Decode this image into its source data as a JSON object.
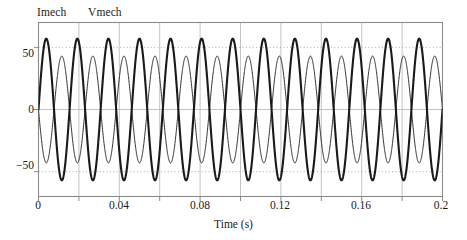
{
  "chart_data": {
    "type": "line",
    "title": "",
    "subtitle": "",
    "xlabel": "Time (s)",
    "ylabel": "",
    "xlim": [
      0,
      0.2
    ],
    "ylim": [
      -70,
      70
    ],
    "xticks": [
      0,
      0.02,
      0.04,
      0.06,
      0.08,
      0.1,
      0.12,
      0.14,
      0.16,
      0.18,
      0.2
    ],
    "xtick_labels": [
      "0",
      "",
      "0.04",
      "",
      "0.08",
      "",
      "0.12",
      "",
      "0.16",
      "",
      "0.2"
    ],
    "yticks": [
      -50,
      0,
      50
    ],
    "ytick_labels": [
      "−50",
      "0",
      "50"
    ],
    "grid": {
      "vertical": "solid at every 0.02 s",
      "horizontal": "dotted at ±50, solid at 0"
    },
    "legend_position": "above plot, top-left",
    "frequency_hz": 65,
    "cycles_shown": 13,
    "series": [
      {
        "name": "Imech",
        "style": "thick",
        "linewidth": 2.1,
        "color": "#1a1a1a",
        "amplitude": 57,
        "phase_deg": 0,
        "offset": 0,
        "description": "Mechanical current, thick trace, starts at 0 rising"
      },
      {
        "name": "Vmech",
        "style": "thin",
        "linewidth": 0.9,
        "color": "#1a1a1a",
        "amplitude": 43,
        "phase_deg": 180,
        "offset": 0,
        "description": "Mechanical voltage, thin trace, starts at 0 falling"
      }
    ]
  },
  "legend": {
    "imech": "Imech",
    "vmech": "Vmech"
  },
  "axis": {
    "x_title": "Time (s)",
    "x_labels": [
      "0",
      "0.04",
      "0.08",
      "0.12",
      "0.16",
      "0.2"
    ],
    "y_labels": [
      "50",
      "0",
      "−50"
    ]
  },
  "colors": {
    "trace": "#1a1a1a",
    "frame": "#8a8a8a",
    "grid_major": "#b4b4b4",
    "grid_dotted": "#9a9a9a",
    "background": "#ffffff",
    "text": "#1a1a1a"
  }
}
